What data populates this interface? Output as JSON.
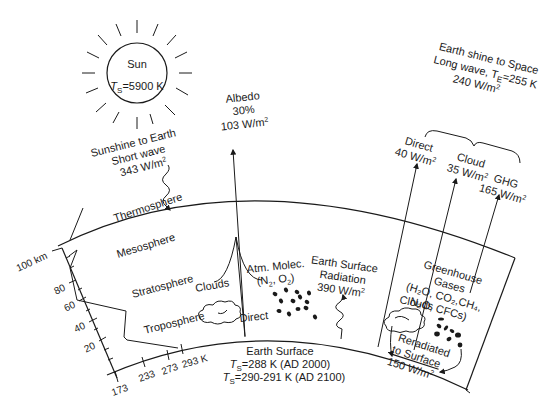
{
  "sun": {
    "label": "Sun",
    "temp_prefix": "T",
    "temp_sub": "S",
    "temp_value": "=5900 K"
  },
  "sunshine": {
    "line1": "Sunshine to Earth",
    "line2": "Short wave",
    "line3": "343 W/m",
    "sup": "2"
  },
  "albedo": {
    "line1": "Albedo",
    "line2": "30%",
    "line3": "103 W/m",
    "sup": "2"
  },
  "earthshine": {
    "line1": "Earth shine to Space",
    "line2_prefix": "Long wave, T",
    "line2_sub": "E",
    "line2_suffix": "=255 K",
    "line3": "240 W/m",
    "sup": "2"
  },
  "outgoing": [
    {
      "name": "Direct",
      "value": "40 W/m",
      "sup": "2"
    },
    {
      "name": "Cloud",
      "value": "35 W/m",
      "sup": "2"
    },
    {
      "name": "GHG",
      "value": "165 W/m",
      "sup": "2"
    }
  ],
  "layers": {
    "thermosphere": "Thermosphere",
    "mesosphere": "Mesosphere",
    "stratosphere": "Stratosphere",
    "troposphere": "Troposphere"
  },
  "altitude_axis": {
    "top_label": "100 km",
    "ticks": [
      "80",
      "60",
      "40",
      "20"
    ]
  },
  "temperature_axis": {
    "ticks": [
      "173",
      "233",
      "273",
      "293 K"
    ]
  },
  "reflection": {
    "clouds": "Clouds",
    "direct": "Direct"
  },
  "atm_molec": {
    "line1": "Atm. Molec.",
    "line2": "(N",
    "sub1": "2",
    "mid": ", O",
    "sub2": "2",
    "end": ")"
  },
  "surface_radiation": {
    "line1": "Earth Surface",
    "line2": "Radiation",
    "line3": "390 W/m",
    "sup": "2"
  },
  "greenhouse": {
    "line1": "Greenhouse",
    "line2": "Gases",
    "line3": "(H₂O, CO₂,CH₄,",
    "line4": "N₂O, CFCs)",
    "clouds": "Clouds"
  },
  "reradiated": {
    "line1": "Reradiated",
    "line2": "to Surface",
    "line3": "150 W/m",
    "sup": "2"
  },
  "earth_surface": {
    "title": "Earth Surface",
    "line1_prefix": "T",
    "line1_sub": "S",
    "line1_value": "=288 K (AD 2000)",
    "line2_prefix": "T",
    "line2_sub": "S",
    "line2_value": "=290-291 K (AD 2100)"
  }
}
